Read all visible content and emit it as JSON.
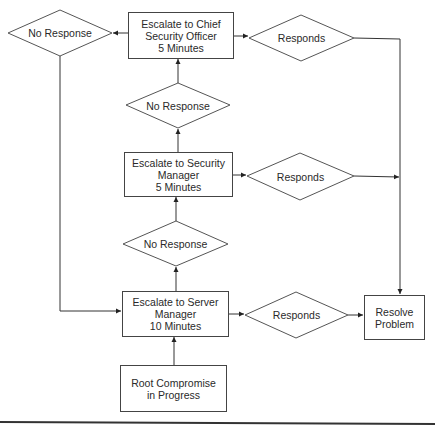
{
  "diagram": {
    "type": "flowchart",
    "nodes": {
      "chief_officer": {
        "label": "Escalate to Chief\nSecurity Officer\n5 Minutes",
        "shape": "rectangle"
      },
      "security_manager": {
        "label": "Escalate to Security\nManager\n5 Minutes",
        "shape": "rectangle"
      },
      "server_manager": {
        "label": "Escalate to Server\nManager\n10 Minutes",
        "shape": "rectangle"
      },
      "root_compromise": {
        "label": "Root Compromise\nin Progress",
        "shape": "rectangle"
      },
      "resolve_problem": {
        "label": "Resolve\nProblem",
        "shape": "rectangle"
      },
      "no_response_top_left": {
        "label": "No Response",
        "shape": "diamond"
      },
      "no_response_upper": {
        "label": "No Response",
        "shape": "diamond"
      },
      "no_response_lower": {
        "label": "No Response",
        "shape": "diamond"
      },
      "responds_top": {
        "label": "Responds",
        "shape": "diamond"
      },
      "responds_middle": {
        "label": "Responds",
        "shape": "diamond"
      },
      "responds_bottom": {
        "label": "Responds",
        "shape": "diamond"
      }
    },
    "edges": [
      {
        "from": "root_compromise",
        "to": "server_manager"
      },
      {
        "from": "server_manager",
        "to": "no_response_lower"
      },
      {
        "from": "no_response_lower",
        "to": "security_manager"
      },
      {
        "from": "security_manager",
        "to": "no_response_upper"
      },
      {
        "from": "no_response_upper",
        "to": "chief_officer"
      },
      {
        "from": "chief_officer",
        "to": "no_response_top_left"
      },
      {
        "from": "no_response_top_left",
        "to": "server_manager"
      },
      {
        "from": "server_manager",
        "to": "responds_bottom"
      },
      {
        "from": "responds_bottom",
        "to": "resolve_problem"
      },
      {
        "from": "security_manager",
        "to": "responds_middle"
      },
      {
        "from": "responds_middle",
        "to": "resolve_problem"
      },
      {
        "from": "chief_officer",
        "to": "responds_top"
      },
      {
        "from": "responds_top",
        "to": "resolve_problem"
      }
    ],
    "colors": {
      "stroke": "#444444",
      "text": "#2a2a2a",
      "background": "#ffffff"
    }
  }
}
